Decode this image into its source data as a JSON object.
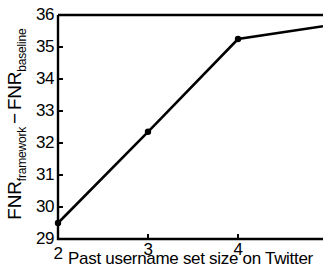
{
  "chart_data": {
    "type": "line",
    "title": "",
    "xlabel": "Past username set size on Twitter",
    "ylabel": "FNR_framework - FNR_baseline",
    "ylabel_parts": {
      "base1": "FNR",
      "sub1": "framework",
      "operator": "−",
      "base2": "FNR",
      "sub2": "baseline"
    },
    "x": [
      2,
      3,
      4
    ],
    "values": [
      29.5,
      32.35,
      35.25
    ],
    "series": [
      {
        "name": "FNR difference",
        "x": [
          2,
          3,
          4
        ],
        "values": [
          29.5,
          32.35,
          35.25
        ]
      }
    ],
    "line_extends_beyond_right_crop": true,
    "value_at_right_crop_edge": 35.65,
    "xlim": [
      2,
      5
    ],
    "ylim": [
      29,
      36
    ],
    "xticks": [
      2,
      3,
      4
    ],
    "xtick_labels": [
      "2",
      "3",
      "4"
    ],
    "yticks": [
      29,
      30,
      31,
      32,
      33,
      34,
      35,
      36
    ],
    "ytick_labels": [
      "29",
      "30",
      "31",
      "32",
      "33",
      "34",
      "35",
      "36"
    ],
    "grid": false,
    "legend": false,
    "marker": "filled-circle",
    "line_color": "#000000",
    "marker_color": "#000000",
    "background_color": "#ffffff",
    "axis_color": "#000000"
  }
}
